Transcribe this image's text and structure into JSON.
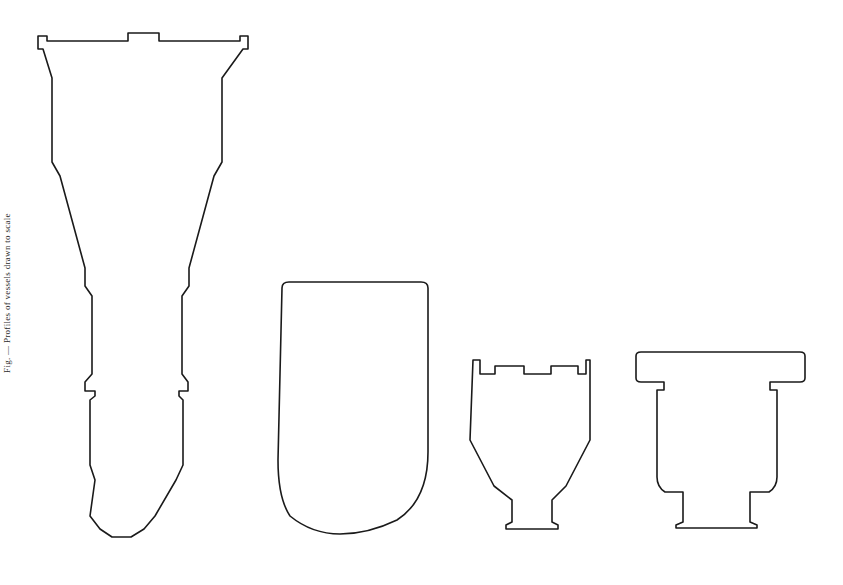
{
  "figure": {
    "background_color": "#ffffff",
    "line_color": "#1a1a1a",
    "line_width": 1.6,
    "width": 843,
    "height": 585,
    "side_caption": "Fig. — Profiles of vessels drawn to scale",
    "object_count": 4
  },
  "objects": [
    {
      "id": "vessel-1",
      "label": "tall flared-rim vessel with narrow waist",
      "bbox": {
        "x": 37,
        "y": 33,
        "width": 212,
        "height": 508
      },
      "features": [
        "notched flat rim",
        "central rim tab",
        "flaring shoulder",
        "tapering body",
        "narrow waist with step",
        "bulbous lower body",
        "rounded tapered base"
      ]
    },
    {
      "id": "vessel-2",
      "label": "rounded-base U-shaped vessel",
      "bbox": {
        "x": 278,
        "y": 281,
        "width": 152,
        "height": 249
      },
      "features": [
        "straight vertical walls",
        "slightly rounded top corners",
        "hemispherical rounded base"
      ]
    },
    {
      "id": "vessel-3",
      "label": "crenellated-rim tapering vessel with small foot",
      "bbox": {
        "x": 470,
        "y": 360,
        "width": 120,
        "height": 168
      },
      "features": [
        "rim with two rectangular notches",
        "straight upper walls",
        "sharply tapering lower body",
        "small flat foot"
      ]
    },
    {
      "id": "vessel-4",
      "label": "wide flanged-rim vessel with stepped foot",
      "bbox": {
        "x": 634,
        "y": 352,
        "width": 172,
        "height": 175
      },
      "features": [
        "broad overhanging flange rim",
        "straight body walls",
        "rounded lower corners",
        "stepped pedestal foot"
      ]
    }
  ],
  "paths": {
    "vessel_1": "M 38 49 L 38 36 L 47 36 L 47 41 L 128 41 L 128 33 L 159 33 L 159 41 L 240 41 L 240 36 L 248 36 L 248 49 L 243 49 L 222 78 L 222 162 L 214 176 L 189 268 L 189 286 L 182 296 L 182 374 L 188 382 L 188 391 L 179 391 L 179 396 L 183 400 L 183 465 L 176 480 L 155 516 L 144 529 L 131 537 L 112 537 L 100 529 L 90 516 L 95 480 L 90 465 L 90 400 L 95 396 L 95 391 L 85 391 L 85 382 L 92 374 L 92 296 L 85 286 L 85 268 L 60 176 L 52 162 L 52 78 L 43 49 Z",
    "vessel_2": "M 282 288 Q 282 282 289 282 L 421 282 Q 428 282 428 288 L 428 452 Q 428 500 397 520 Q 368 534 340 534 Q 312 534 290 516 Q 278 498 278 460 Z",
    "vessel_3": "M 473 360 L 480 360 L 480 374 L 495 374 L 495 366 L 524 366 L 524 374 L 551 374 L 551 366 L 578 366 L 578 374 L 586 374 L 586 360 L 590 360 L 590 440 L 566 486 L 552 500 L 552 522 L 558 525 L 558 529 L 506 529 L 506 525 L 512 522 L 512 500 L 494 486 L 470 440 Z",
    "vessel_4": "M 636 356 Q 636 352 641 352 L 800 352 Q 805 352 805 356 L 805 378 Q 805 382 800 382 L 770 382 L 770 390 L 777 390 L 777 477 Q 777 487 769 492 L 750 492 L 750 522 L 757 525 L 757 528 L 676 528 L 676 525 L 683 522 L 683 492 L 665 492 Q 657 487 657 477 L 657 390 L 664 390 L 664 382 L 641 382 Q 636 382 636 378 Z"
  }
}
